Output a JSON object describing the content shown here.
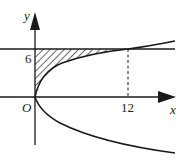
{
  "diagram": {
    "type": "coordinate-graph",
    "axes": {
      "x_label": "x",
      "y_label": "y",
      "origin_label": "O"
    },
    "ticks": {
      "y_tick_label": "6",
      "x_tick_label": "12"
    },
    "curves": [
      {
        "name": "parabola",
        "equation": "y^2 = 3x"
      },
      {
        "name": "horizontal-line",
        "equation": "y = 6"
      },
      {
        "name": "dashed-vertical",
        "equation": "x = 12",
        "style": "dashed"
      }
    ],
    "shaded_region": {
      "bounds": "x from 0 to parabola, y from 0 to 6",
      "pattern": "diagonal-hatch"
    },
    "intersection_point": {
      "x": 12,
      "y": 6
    },
    "colors": {
      "stroke": "#1a1a1a",
      "background": "#ffffff"
    }
  }
}
